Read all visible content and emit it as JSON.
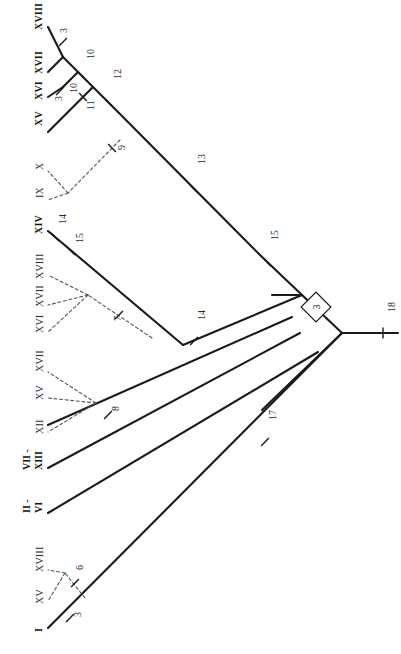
{
  "figure": {
    "type": "cladogram",
    "orientation": "rotated-90-left",
    "background": "#ffffff",
    "line_color": "#1a1a1a",
    "dashed_color": "#555555"
  },
  "taxa": [
    {
      "id": "t-xviii-top",
      "label": "XVIII",
      "bold": true,
      "x": 33,
      "y": 30,
      "tip": {
        "x": 63,
        "y": 27
      }
    },
    {
      "id": "t-xvii",
      "label": "XVII",
      "bold": true,
      "x": 33,
      "y": 74,
      "tip": {
        "x": 66,
        "y": 71
      }
    },
    {
      "id": "t-xvi",
      "label": "XVI",
      "bold": true,
      "x": 33,
      "y": 100,
      "tip": {
        "x": 62,
        "y": 97
      }
    },
    {
      "id": "t-xv-top",
      "label": "XV",
      "bold": true,
      "x": 33,
      "y": 126,
      "tip": {
        "x": 56,
        "y": 123
      }
    },
    {
      "id": "t-x",
      "label": "X",
      "bold": false,
      "x": 34,
      "y": 170,
      "tip": {
        "x": 56,
        "y": 168
      }
    },
    {
      "id": "t-ix",
      "label": "IX",
      "bold": false,
      "x": 34,
      "y": 198,
      "tip": {
        "x": 56,
        "y": 196
      }
    },
    {
      "id": "t-xiv",
      "label": "XIV",
      "bold": true,
      "x": 33,
      "y": 234,
      "tip": {
        "x": 57,
        "y": 230
      }
    },
    {
      "id": "t-xviii-2",
      "label": "XVIII",
      "bold": false,
      "x": 34,
      "y": 279,
      "tip": {
        "x": 57,
        "y": 277
      }
    },
    {
      "id": "t-xvii-2",
      "label": "XVII",
      "bold": false,
      "x": 34,
      "y": 307,
      "tip": {
        "x": 55,
        "y": 305
      }
    },
    {
      "id": "t-xvi-2",
      "label": "XVI",
      "bold": false,
      "x": 34,
      "y": 333,
      "tip": {
        "x": 55,
        "y": 331
      }
    },
    {
      "id": "t-xvii-3",
      "label": "XVII",
      "bold": false,
      "x": 34,
      "y": 372,
      "tip": {
        "x": 55,
        "y": 370
      }
    },
    {
      "id": "t-xv-2",
      "label": "XV",
      "bold": false,
      "x": 34,
      "y": 400,
      "tip": {
        "x": 55,
        "y": 398
      }
    },
    {
      "id": "t-xii-2",
      "label": "XII",
      "bold": false,
      "x": 34,
      "y": 434,
      "tip": {
        "x": 55,
        "y": 432
      }
    },
    {
      "id": "t-xviii-3",
      "label": "XVIII",
      "bold": false,
      "x": 34,
      "y": 572,
      "tip": {
        "x": 57,
        "y": 570
      }
    },
    {
      "id": "t-xv-3",
      "label": "XV",
      "bold": false,
      "x": 34,
      "y": 604,
      "tip": {
        "x": 57,
        "y": 602
      }
    },
    {
      "id": "t-i",
      "label": "I",
      "bold": true,
      "x": 33,
      "y": 632,
      "tip": {
        "x": 55,
        "y": 628
      }
    }
  ],
  "range_taxa": [
    {
      "id": "r-vii-xiii",
      "top": "VII -",
      "bottom": "XIII",
      "x_top": 22,
      "x_bottom": 34,
      "y": 470
    },
    {
      "id": "r-ii-vi",
      "top": "II -",
      "bottom": "VI",
      "x_top": 22,
      "x_bottom": 34,
      "y": 513
    }
  ],
  "node_numbers": [
    {
      "id": "n-3a",
      "value": "3",
      "x": 58,
      "y": 33
    },
    {
      "id": "n-10a",
      "value": "10",
      "x": 85,
      "y": 59
    },
    {
      "id": "n-3b",
      "value": "3",
      "x": 53,
      "y": 101
    },
    {
      "id": "n-10b",
      "value": "10",
      "x": 68,
      "y": 93
    },
    {
      "id": "n-11",
      "value": "11",
      "x": 85,
      "y": 110
    },
    {
      "id": "n-12",
      "value": "12",
      "x": 112,
      "y": 79
    },
    {
      "id": "n-9",
      "value": "9",
      "x": 116,
      "y": 150
    },
    {
      "id": "n-13",
      "value": "13",
      "x": 196,
      "y": 164
    },
    {
      "id": "n-14a",
      "value": "14",
      "x": 57,
      "y": 224
    },
    {
      "id": "n-15a",
      "value": "15",
      "x": 74,
      "y": 243
    },
    {
      "id": "n-7",
      "value": "7",
      "x": 112,
      "y": 321
    },
    {
      "id": "n-14b",
      "value": "14",
      "x": 196,
      "y": 320
    },
    {
      "id": "n-15b",
      "value": "15",
      "x": 269,
      "y": 240
    },
    {
      "id": "n-8",
      "value": "8",
      "x": 110,
      "y": 411
    },
    {
      "id": "n-17",
      "value": "17",
      "x": 267,
      "y": 420
    },
    {
      "id": "n-6",
      "value": "6",
      "x": 74,
      "y": 570
    },
    {
      "id": "n-3c",
      "value": "3",
      "x": 72,
      "y": 617
    },
    {
      "id": "n-18",
      "value": "18",
      "x": 386,
      "y": 312
    }
  ],
  "boxed_node": {
    "id": "boxed-3",
    "value": "3",
    "cx": 316,
    "cy": 307
  },
  "solid_edges": [
    {
      "id": "e-root-stem",
      "x1": 398,
      "y1": 333,
      "x2": 342,
      "y2": 333
    },
    {
      "id": "e-root-up",
      "x1": 342,
      "y1": 333,
      "x2": 302,
      "y2": 295
    },
    {
      "id": "e-root-down",
      "x1": 342,
      "y1": 333,
      "x2": 262,
      "y2": 410
    },
    {
      "id": "e-n15-branch",
      "x1": 302,
      "y1": 295,
      "x2": 261,
      "y2": 256
    },
    {
      "id": "e-main-13",
      "x1": 261,
      "y1": 256,
      "x2": 118,
      "y2": 112
    },
    {
      "id": "e-12-11",
      "x1": 118,
      "y1": 112,
      "x2": 93,
      "y2": 87
    },
    {
      "id": "e-11-10",
      "x1": 93,
      "y1": 87,
      "x2": 78,
      "y2": 72
    },
    {
      "id": "e-10-3a",
      "x1": 78,
      "y1": 72,
      "x2": 63,
      "y2": 57
    },
    {
      "id": "e-3a-xviii",
      "x1": 63,
      "y1": 57,
      "x2": 48,
      "y2": 27
    },
    {
      "id": "e-3a-xvii",
      "x1": 63,
      "y1": 57,
      "x2": 48,
      "y2": 72
    },
    {
      "id": "e-10-3b",
      "x1": 78,
      "y1": 72,
      "x2": 63,
      "y2": 87
    },
    {
      "id": "e-3b-xvi",
      "x1": 63,
      "y1": 87,
      "x2": 48,
      "y2": 97
    },
    {
      "id": "e-11-xv",
      "x1": 93,
      "y1": 87,
      "x2": 48,
      "y2": 132
    },
    {
      "id": "e-xiv-15a",
      "x1": 48,
      "y1": 231,
      "x2": 183,
      "y2": 345
    },
    {
      "id": "e-15a-14b",
      "x1": 183,
      "y1": 345,
      "x2": 302,
      "y2": 295
    },
    {
      "id": "e-14b-branch",
      "x1": 302,
      "y1": 295,
      "x2": 272,
      "y2": 295
    },
    {
      "id": "e-leaf-8",
      "x1": 48,
      "y1": 425,
      "x2": 292,
      "y2": 317
    },
    {
      "id": "e-leaf-xiii",
      "x1": 48,
      "y1": 468,
      "x2": 300,
      "y2": 333
    },
    {
      "id": "e-leaf-vi",
      "x1": 48,
      "y1": 513,
      "x2": 318,
      "y2": 352
    },
    {
      "id": "e-leaf-i",
      "x1": 48,
      "y1": 628,
      "x2": 342,
      "y2": 333
    }
  ],
  "dashed_edges": [
    {
      "id": "d-9-fan",
      "x1": 120,
      "y1": 140,
      "x2": 68,
      "y2": 193
    },
    {
      "id": "d-9-x",
      "x1": 68,
      "y1": 193,
      "x2": 48,
      "y2": 171
    },
    {
      "id": "d-9-ix",
      "x1": 68,
      "y1": 193,
      "x2": 48,
      "y2": 200
    },
    {
      "id": "d-7-hub",
      "x1": 152,
      "y1": 338,
      "x2": 88,
      "y2": 295
    },
    {
      "id": "d-7-a",
      "x1": 88,
      "y1": 295,
      "x2": 48,
      "y2": 275
    },
    {
      "id": "d-7-b",
      "x1": 88,
      "y1": 295,
      "x2": 48,
      "y2": 305
    },
    {
      "id": "d-7-c",
      "x1": 88,
      "y1": 295,
      "x2": 48,
      "y2": 332
    },
    {
      "id": "d-8-a",
      "x1": 96,
      "y1": 403,
      "x2": 48,
      "y2": 372
    },
    {
      "id": "d-8-b",
      "x1": 96,
      "y1": 403,
      "x2": 48,
      "y2": 398
    },
    {
      "id": "d-8-c",
      "x1": 96,
      "y1": 403,
      "x2": 48,
      "y2": 432
    },
    {
      "id": "d-6-hub",
      "x1": 85,
      "y1": 598,
      "x2": 65,
      "y2": 573
    },
    {
      "id": "d-6-a",
      "x1": 65,
      "y1": 573,
      "x2": 48,
      "y2": 570
    },
    {
      "id": "d-6-b",
      "x1": 65,
      "y1": 573,
      "x2": 48,
      "y2": 601
    }
  ],
  "tick_marks": [
    {
      "id": "tk-3a",
      "cx": 63,
      "cy": 42,
      "angle": -45
    },
    {
      "id": "tk-10a",
      "cx": 83,
      "cy": 77,
      "angle": 45
    },
    {
      "id": "tk-3b",
      "cx": 60,
      "cy": 91,
      "angle": -45
    },
    {
      "id": "tk-11",
      "cx": 83,
      "cy": 97,
      "angle": 45
    },
    {
      "id": "tk-12",
      "cx": 110,
      "cy": 104,
      "angle": 45
    },
    {
      "id": "tk-9",
      "cx": 112,
      "cy": 148,
      "angle": 45
    },
    {
      "id": "tk-13",
      "cx": 194,
      "cy": 189,
      "angle": 45
    },
    {
      "id": "tk-14a",
      "cx": 55,
      "cy": 237,
      "angle": 45
    },
    {
      "id": "tk-15a",
      "cx": 71,
      "cy": 251,
      "angle": 45
    },
    {
      "id": "tk-7",
      "cx": 119,
      "cy": 315,
      "angle": -45
    },
    {
      "id": "tk-14b",
      "cx": 194,
      "cy": 341,
      "angle": -45
    },
    {
      "id": "tk-15b",
      "cx": 267,
      "cy": 262,
      "angle": 45
    },
    {
      "id": "tk-8",
      "cx": 108,
      "cy": 415,
      "angle": -45
    },
    {
      "id": "tk-17",
      "cx": 265,
      "cy": 442,
      "angle": -45
    },
    {
      "id": "tk-6",
      "cx": 75,
      "cy": 583,
      "angle": -45
    },
    {
      "id": "tk-3c",
      "cx": 70,
      "cy": 618,
      "angle": -45
    },
    {
      "id": "tk-18",
      "cx": 383,
      "cy": 333,
      "angle": 90
    }
  ]
}
